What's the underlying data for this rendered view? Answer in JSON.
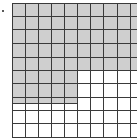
{
  "figure": {
    "type": "hundred-grid",
    "rows": 10,
    "columns": 10,
    "shade_color": "#cfcfcf",
    "line_color": "#3a3a3a",
    "background_color": "#ffffff",
    "shaded_regions": [
      {
        "description": "rows 1-5, all 10 columns",
        "cells": 50
      },
      {
        "description": "rows 6-7, columns 1-5",
        "cells": 10
      },
      {
        "description": "row 8 top half, columns 1-5",
        "cells": 2.5
      }
    ],
    "shaded_total": 62.5,
    "total_cells": 100
  }
}
